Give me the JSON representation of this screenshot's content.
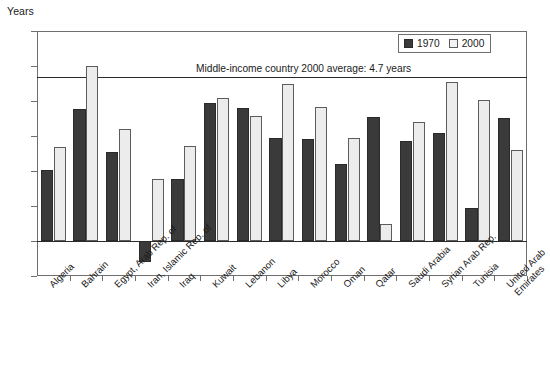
{
  "chart_data": {
    "type": "bar",
    "title": "",
    "xlabel": "",
    "ylabel": "Years",
    "ylim": [
      -1,
      6
    ],
    "yticks": [
      6,
      5,
      4,
      3,
      2,
      1,
      0,
      -1
    ],
    "ytick_labels": [
      "6",
      "5",
      "4",
      "3",
      "2",
      "1",
      "0",
      "−1"
    ],
    "grid": false,
    "legend_position": "top-right",
    "categories": [
      "Algeria",
      "Bahrain",
      "Egypt, Arab Rep. of",
      "Iran, Islamic Rep. of",
      "Iraq",
      "Kuwait",
      "Lebanon",
      "Libya",
      "Morocco",
      "Oman",
      "Qatar",
      "Saudi Arabia",
      "Syrian Arab Rep.",
      "Tunisia",
      "United Arab\nEmirates"
    ],
    "series": [
      {
        "name": "1970",
        "color": "#3a3a3a",
        "values": [
          2.03,
          3.78,
          2.53,
          -0.6,
          1.78,
          3.93,
          3.8,
          2.95,
          2.92,
          2.2,
          3.55,
          2.87,
          3.1,
          0.93,
          3.52
        ]
      },
      {
        "name": "2000",
        "color": "#ececec",
        "values": [
          2.69,
          5.0,
          3.2,
          1.77,
          2.72,
          4.08,
          3.57,
          4.5,
          3.83,
          2.93,
          0.48,
          3.4,
          4.55,
          4.03,
          2.6
        ]
      }
    ],
    "annotations": [
      {
        "name": "middle-income-average-line",
        "text": "Middle-income country 2000 average: 4.7 years",
        "value": 4.7
      }
    ]
  },
  "legend": {
    "entries": [
      {
        "label": "1970"
      },
      {
        "label": "2000"
      }
    ]
  }
}
